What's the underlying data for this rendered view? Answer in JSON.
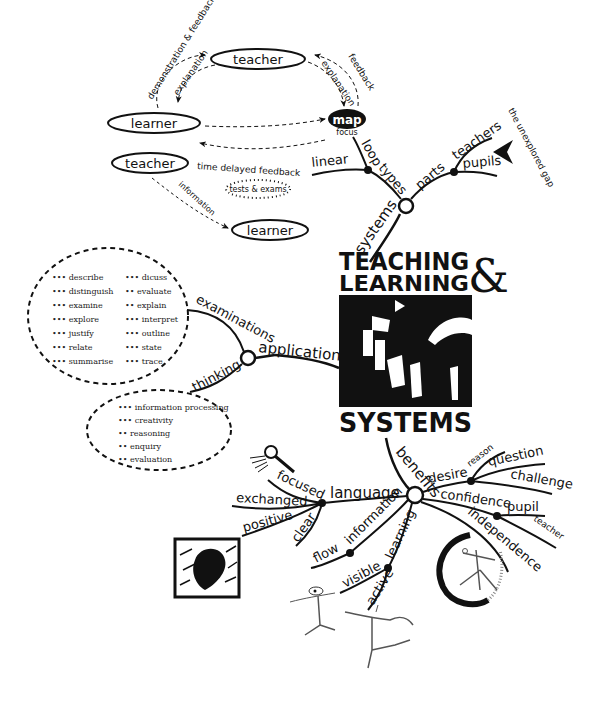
{
  "title": {
    "line1": "TEACHING",
    "line2": "LEARNING",
    "ampersand": "&",
    "line3": "SYSTEMS"
  },
  "feedback_loops": {
    "top_cycle": {
      "teacher": "teacher",
      "learner": "learner",
      "map": "map",
      "map_sub": "focus",
      "arrows": [
        "demonstration & feedback",
        "explanation",
        "feedback",
        "explanation"
      ]
    },
    "bottom_cycle": {
      "teacher": "teacher",
      "learner": "learner",
      "time_delayed": "time delayed feedback",
      "tests": "tests & exams",
      "information": "information"
    }
  },
  "systems_branch": {
    "label": "systems",
    "types": {
      "label": "types",
      "children": [
        "loop",
        "linear"
      ]
    },
    "parts": {
      "label": "parts",
      "children": [
        "teachers",
        "pupils"
      ]
    },
    "gap_note": "the unexplored gap"
  },
  "applications_branch": {
    "label": "applications",
    "examinations": {
      "label": "examinations",
      "col1": [
        "describe",
        "distinguish",
        "examine",
        "explore",
        "justify",
        "relate",
        "summarise"
      ],
      "col2": [
        "dicuss",
        "evaluate",
        "explain",
        "interpret",
        "outline",
        "state",
        "trace"
      ]
    },
    "thinking": {
      "label": "thinking",
      "items": [
        "information processing",
        "creativity",
        "reasoning",
        "enquiry",
        "evaluation"
      ]
    }
  },
  "benefits_branch": {
    "label": "benefits",
    "language": {
      "label": "language",
      "children": [
        "focused",
        "exchanged",
        "positive",
        "clear"
      ]
    },
    "information": {
      "label": "information",
      "children": [
        "flow"
      ]
    },
    "learning": {
      "label": "learning",
      "children": [
        "visible",
        "active"
      ]
    },
    "desire": {
      "label": "desire",
      "children": [
        "reason",
        "question",
        "challenge"
      ]
    },
    "confidence": {
      "label": "confidence",
      "children": [
        "pupil",
        "teacher"
      ]
    },
    "independence": {
      "label": "independence"
    }
  },
  "colors": {
    "ink": "#111111",
    "background": "#ffffff"
  }
}
